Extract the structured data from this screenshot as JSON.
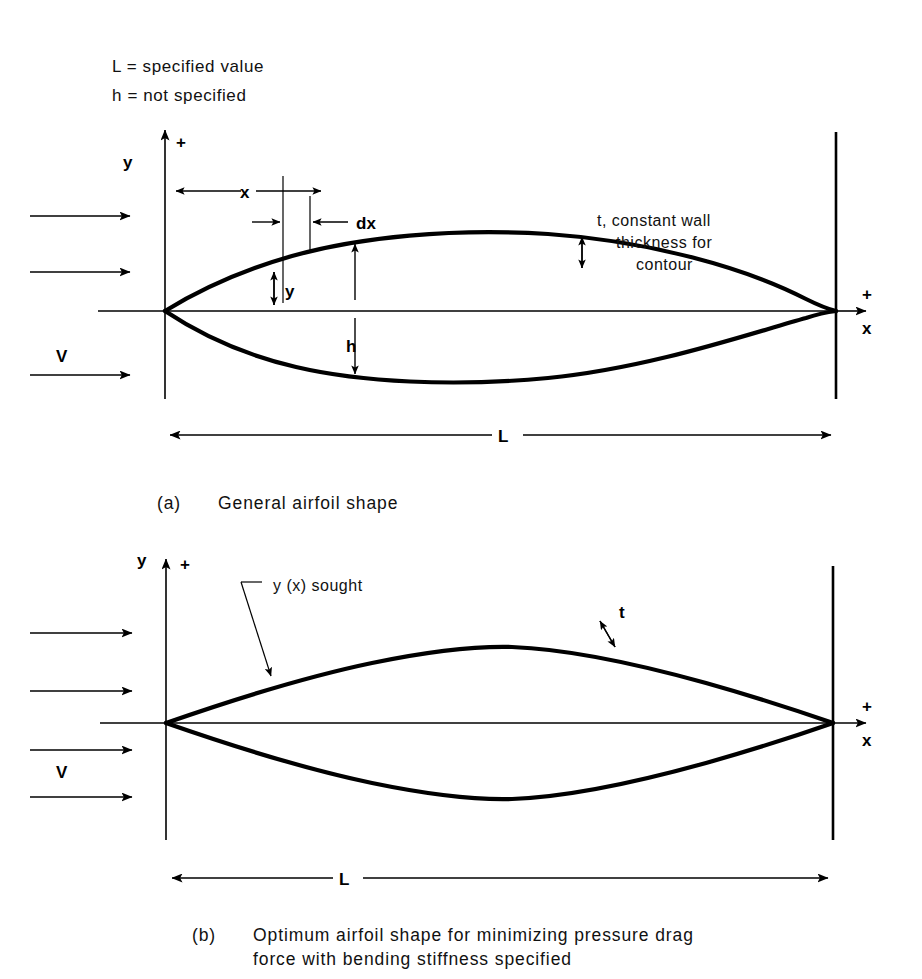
{
  "figure": {
    "legend": {
      "line1": "L  =  specified value",
      "line2": "h  =  not specified"
    },
    "panel_a": {
      "caption_tag": "(a)",
      "caption_text": "General airfoil shape",
      "axis_y_label": "y",
      "axis_y_plus": "+",
      "axis_x_label": "x",
      "axis_x_plus": "+",
      "velocity_label": "V",
      "dim_x": "x",
      "dim_dx": "dx",
      "dim_y": "y",
      "dim_h": "h",
      "dim_L": "L",
      "thickness_note_line1": "t, constant wall",
      "thickness_note_line2": "thickness for",
      "thickness_note_line3": "contour"
    },
    "panel_b": {
      "caption_tag": "(b)",
      "caption_line1": "Optimum airfoil shape for minimizing  pressure  drag",
      "caption_line2": "force with  bending stiffness specified",
      "axis_y_label": "y",
      "axis_y_plus": "+",
      "axis_x_label": "x",
      "axis_x_plus": "+",
      "velocity_label": "V",
      "callout_label": "y (x) sought",
      "thickness_label": "t",
      "dim_L": "L"
    },
    "colors": {
      "ink": "#000000",
      "paper": "#ffffff"
    }
  }
}
